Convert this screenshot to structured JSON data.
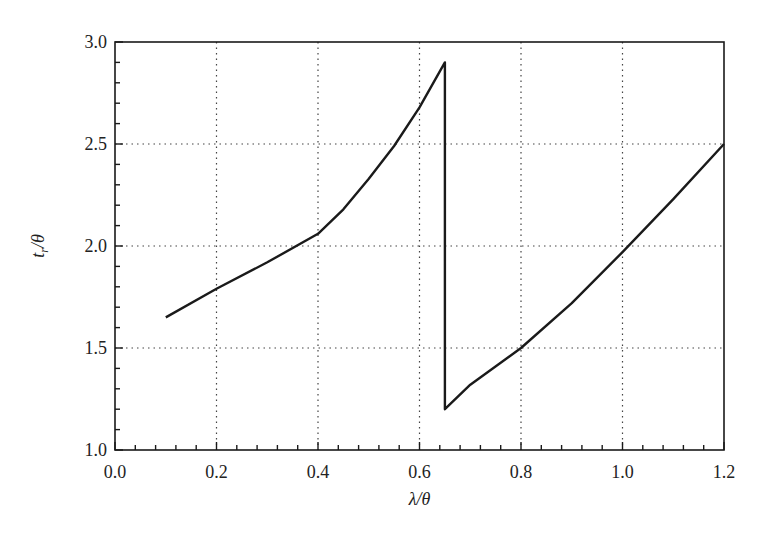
{
  "chart_data": {
    "type": "line",
    "title": "",
    "xlabel": "λ/θ",
    "ylabel": "t_r/θ",
    "xlim": [
      0.0,
      1.2
    ],
    "ylim": [
      1.0,
      3.0
    ],
    "grid": true,
    "grid_style": "dotted",
    "legend": null,
    "x_ticks": [
      0.0,
      0.2,
      0.4,
      0.6,
      0.8,
      1.0,
      1.2
    ],
    "x_tick_labels": [
      "0.0",
      "0.2",
      "0.4",
      "0.6",
      "0.8",
      "1.0",
      "1.2"
    ],
    "y_ticks": [
      1.0,
      1.5,
      2.0,
      2.5,
      3.0
    ],
    "y_tick_labels": [
      "1.0",
      "1.5",
      "2.0",
      "2.5",
      "3.0"
    ],
    "x_minor_step": 0.04,
    "y_minor_step": 0.1,
    "series": [
      {
        "name": "t_r/θ",
        "color": "#1a1a1a",
        "x": [
          0.1,
          0.2,
          0.3,
          0.4,
          0.45,
          0.5,
          0.55,
          0.6,
          0.65,
          0.65,
          0.7,
          0.8,
          0.9,
          1.0,
          1.1,
          1.2
        ],
        "y": [
          1.65,
          1.79,
          1.92,
          2.06,
          2.18,
          2.33,
          2.49,
          2.68,
          2.9,
          1.2,
          1.32,
          1.5,
          1.72,
          1.97,
          2.23,
          2.5
        ]
      }
    ]
  },
  "axes": {
    "x_label_main": "λ/θ",
    "y_label_prefix": "t",
    "y_label_sub": "r",
    "y_label_suffix": "/θ"
  }
}
